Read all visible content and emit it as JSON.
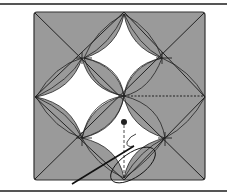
{
  "figure": {
    "colors": {
      "fill": "#9a9a9a",
      "line": "#222222",
      "background": "#ffffff"
    }
  }
}
